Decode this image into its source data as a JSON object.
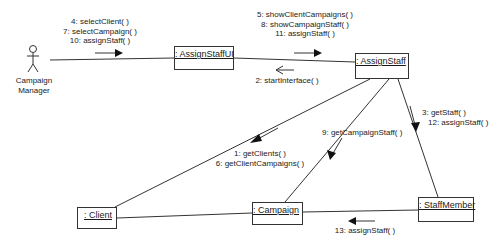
{
  "diagram": {
    "type": "UML communication diagram",
    "actor": {
      "name_line1": "Campaign",
      "name_line2": "Manager"
    },
    "objects": {
      "assign_staff_ui": ": AssignStaffUI",
      "assign_staff": ": AssignStaff",
      "client": ": Client",
      "campaign": ": Campaign",
      "staff_member": ": StaffMember"
    },
    "messages": {
      "actor_to_ui": [
        "4: selectClient( )",
        "7: selectCampaign( )",
        "10: assignStaff( )"
      ],
      "ui_to_control": [
        "5: showClientCampaigns( )",
        "8: showCampaignStaff( )",
        "11: assignStaff( )"
      ],
      "control_to_ui": [
        "2: startInterface( )"
      ],
      "control_to_client": [
        "1: getClients( )",
        "6: getClientCampaigns( )"
      ],
      "control_to_campaign": [
        "9: getCampaignStaff( )"
      ],
      "control_to_staff": [
        "3: getStaff( )",
        "12: assignStaff( )"
      ],
      "staff_to_campaign": [
        "13: assignStaff( )"
      ]
    }
  }
}
